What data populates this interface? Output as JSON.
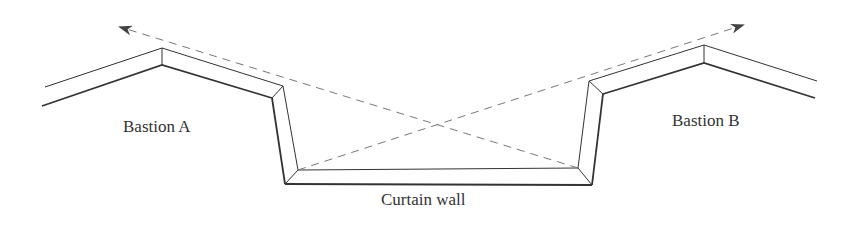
{
  "diagram": {
    "labels": {
      "bastion_a": "Bastion A",
      "bastion_b": "Bastion B",
      "curtain_wall": "Curtain wall"
    },
    "colors": {
      "line": "#333333",
      "dashed": "#777777"
    }
  }
}
